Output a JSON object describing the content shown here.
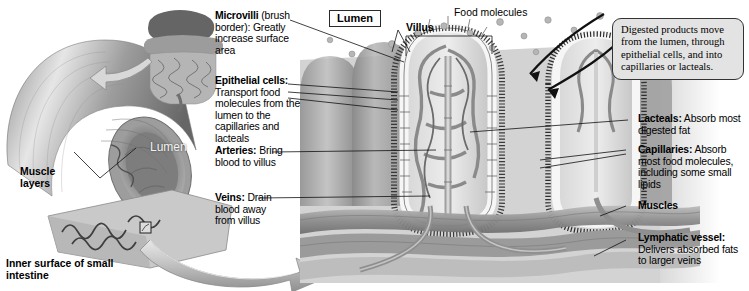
{
  "figure": {
    "background_color": "#ffffff",
    "ink_color": "#000000"
  },
  "boxed_labels": [
    {
      "id": "lumen-box",
      "text": "Lumen"
    }
  ],
  "callouts": [
    {
      "id": "digested-products-callout",
      "text": "Digested products move from the lumen, through epithelial cells, and into capillaries or lacteals.",
      "fill": "#e3e3e3",
      "border": "#333333",
      "font": "serif"
    }
  ],
  "left_labels": [
    {
      "id": "microvilli",
      "term": "Microvilli",
      "rest": " (brush border): Greatly increase surface area"
    },
    {
      "id": "epithelial-cells",
      "term": "Epithelial cells:",
      "rest": " Transport food molecules from the lumen to the capillaries and lacteals"
    },
    {
      "id": "arteries",
      "term": "Arteries:",
      "rest": " Bring blood to villus"
    },
    {
      "id": "veins",
      "term": "Veins:",
      "rest": " Drain blood away from villus"
    }
  ],
  "right_labels": [
    {
      "id": "lacteals",
      "term": "Lacteals:",
      "rest": " Absorb most digested fat"
    },
    {
      "id": "capillaries",
      "term": "Capillaries:",
      "rest": " Absorb most food molecules, including some small lipids"
    },
    {
      "id": "muscles",
      "term": "Muscles",
      "rest": ""
    },
    {
      "id": "lymphatic-vessel",
      "term": "Lymphatic vessel:",
      "rest": " Delivers absorbed fats to larger veins"
    }
  ],
  "overlay_labels": [
    {
      "id": "villus",
      "text": "Villus",
      "weight": "bold"
    },
    {
      "id": "food-molecules",
      "text": "Food molecules",
      "weight": "normal"
    },
    {
      "id": "muscle-layers",
      "text": "Muscle layers",
      "weight": "bold"
    },
    {
      "id": "inner-surface",
      "text": "Inner surface of small intestine",
      "weight": "bold"
    },
    {
      "id": "tube-lumen",
      "text": "Lumen",
      "weight": "normal",
      "color": "#f2f2f2"
    }
  ],
  "artwork": {
    "intestine_tube": "cut-away segment of small intestine showing muscle layers and lumen",
    "anatomy_inset": "small gray drawing of abdominal intestines with curved arrow",
    "inner_surface_flap": "peeled flap showing folded inner surface with magnifier square",
    "sweep_arrow": "large 3D gray arrow sweeping right into the villus cross-section",
    "villi": "row of finger-like villi lined with epithelial cells and microvilli brush border",
    "vessels": "capillary network, central lacteal, arteriole and venule inside each villus",
    "muscle_bands": "horizontal muscle and vessel bands beneath the villi",
    "food_molecule_dots": "small gray circles in the lumen above the villi",
    "arrows_dark": "two black curved arrows from lumen into the villus interior"
  }
}
